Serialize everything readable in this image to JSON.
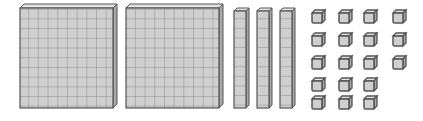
{
  "diagram": {
    "colors": {
      "face": "#cfcfcf",
      "top": "#e4e4e4",
      "side": "#a8a8a8",
      "stroke": "#555555",
      "grid": "#7a7a7a"
    },
    "hundreds": {
      "count": 2,
      "value_each": 100
    },
    "tens": {
      "count": 3,
      "value_each": 10
    },
    "ones": {
      "count": 18,
      "value_each": 1,
      "columns": [
        5,
        5,
        5,
        3
      ]
    },
    "total_value": 248
  }
}
